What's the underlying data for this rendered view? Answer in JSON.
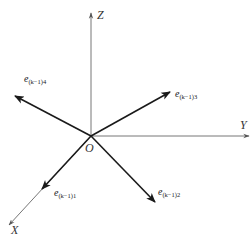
{
  "diagram": {
    "origin": {
      "label": "O",
      "x": 91,
      "y": 136
    },
    "axes": [
      {
        "id": "z",
        "label": "Z",
        "end": [
          91,
          12
        ]
      },
      {
        "id": "y",
        "label": "Y",
        "end": [
          250,
          136
        ]
      },
      {
        "id": "x",
        "label": "X",
        "end": [
          8,
          226
        ]
      }
    ],
    "vectors": [
      {
        "id": "e4",
        "base": "e",
        "subscript": "(k−1)4",
        "end": [
          14,
          96
        ]
      },
      {
        "id": "e3",
        "base": "e",
        "subscript": "(k−1)3",
        "end": [
          171,
          91
        ]
      },
      {
        "id": "e1",
        "base": "e",
        "subscript": "(k−1)1",
        "end": [
          42,
          190
        ]
      },
      {
        "id": "e2",
        "base": "e",
        "subscript": "(k−1)2",
        "end": [
          156,
          203
        ]
      }
    ],
    "colors": {
      "axis": "#555555",
      "vector": "#1a1a1a",
      "background": "#ffffff"
    }
  }
}
